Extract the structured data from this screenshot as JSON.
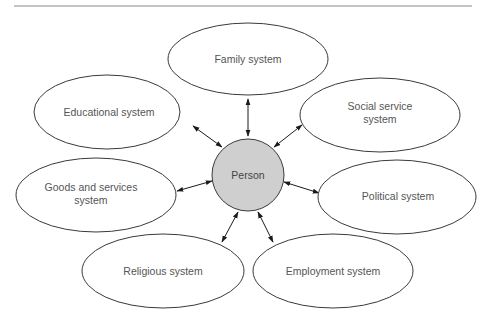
{
  "diagram": {
    "center": {
      "label": "Person",
      "fill": "#cfcfcf"
    },
    "nodes": [
      {
        "id": "family",
        "lines": [
          "Family system"
        ]
      },
      {
        "id": "educational",
        "lines": [
          "Educational system"
        ]
      },
      {
        "id": "social",
        "lines": [
          "Social service",
          "system"
        ]
      },
      {
        "id": "goods",
        "lines": [
          "Goods and services",
          "system"
        ]
      },
      {
        "id": "political",
        "lines": [
          "Political system"
        ]
      },
      {
        "id": "religious",
        "lines": [
          "Religious system"
        ]
      },
      {
        "id": "employment",
        "lines": [
          "Employment system"
        ]
      }
    ],
    "edges": [
      {
        "from": "Person",
        "to": "Family system",
        "direction": "bidirectional"
      },
      {
        "from": "Person",
        "to": "Educational system",
        "direction": "bidirectional"
      },
      {
        "from": "Person",
        "to": "Social service system",
        "direction": "bidirectional"
      },
      {
        "from": "Person",
        "to": "Goods and services system",
        "direction": "bidirectional"
      },
      {
        "from": "Person",
        "to": "Political system",
        "direction": "bidirectional"
      },
      {
        "from": "Person",
        "to": "Religious system",
        "direction": "bidirectional"
      },
      {
        "from": "Person",
        "to": "Employment system",
        "direction": "bidirectional"
      }
    ]
  }
}
